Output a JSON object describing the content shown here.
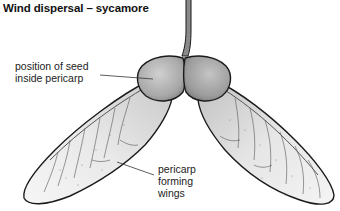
{
  "title": "Wind dispersal – sycamore",
  "labels": {
    "seed_position": [
      "position of seed",
      "inside pericarp"
    ],
    "pericarp_wings": [
      "pericarp",
      "forming",
      "wings"
    ]
  },
  "colors": {
    "outline": "#1a1a1a",
    "seed_fill": "#b8b8b8",
    "wing_fill": "#e6e6e6",
    "vein": "#444444",
    "text": "#222222"
  }
}
